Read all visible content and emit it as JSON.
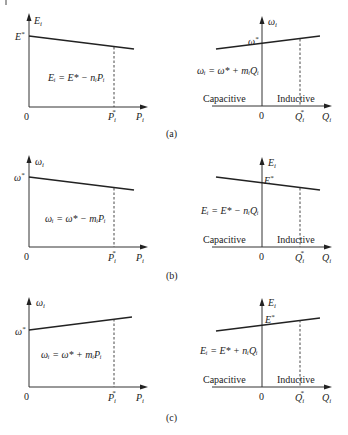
{
  "figure": {
    "panels": [
      {
        "id": "a",
        "caption": "(a)",
        "left": {
          "y_axis_label": "E",
          "y_axis_sub": "i",
          "x_axis_label": "P",
          "x_axis_sub": "i",
          "origin": "0",
          "intercept_label": "E",
          "intercept_sup": "*",
          "rated_label": "P",
          "rated_sub": "i",
          "rated_sup": "*",
          "equation": "Eᵢ = E* − nᵢPᵢ",
          "slope": "negative"
        },
        "right": {
          "y_axis_label": "ω",
          "y_axis_sub": "i",
          "x_axis_label": "Q",
          "x_axis_sub": "i",
          "origin": "0",
          "intercept_label": "ω",
          "intercept_sup": "*",
          "rated_label": "Q",
          "rated_sub": "i",
          "rated_sup": "*",
          "equation": "ωᵢ = ω* + mᵢQᵢ",
          "region_left": "Capacitive",
          "region_right": "Inductive",
          "slope": "positive"
        }
      },
      {
        "id": "b",
        "caption": "(b)",
        "left": {
          "y_axis_label": "ω",
          "y_axis_sub": "i",
          "x_axis_label": "P",
          "x_axis_sub": "i",
          "origin": "0",
          "intercept_label": "ω",
          "intercept_sup": "*",
          "rated_label": "P",
          "rated_sub": "i",
          "rated_sup": "*",
          "equation": "ωᵢ = ω* − mᵢPᵢ",
          "slope": "negative"
        },
        "right": {
          "y_axis_label": "E",
          "y_axis_sub": "i",
          "x_axis_label": "Q",
          "x_axis_sub": "i",
          "origin": "0",
          "intercept_label": "E",
          "intercept_sup": "*",
          "rated_label": "Q",
          "rated_sub": "i",
          "rated_sup": "*",
          "equation": "Eᵢ = E* − nᵢQᵢ",
          "region_left": "Capacitive",
          "region_right": "Inductive",
          "slope": "negative"
        }
      },
      {
        "id": "c",
        "caption": "(c)",
        "left": {
          "y_axis_label": "ω",
          "y_axis_sub": "i",
          "x_axis_label": "P",
          "x_axis_sub": "i",
          "origin": "0",
          "intercept_label": "ω",
          "intercept_sup": "*",
          "rated_label": "P",
          "rated_sub": "i",
          "rated_sup": "*",
          "equation": "ωᵢ = ω* + mᵢPᵢ",
          "slope": "positive"
        },
        "right": {
          "y_axis_label": "E",
          "y_axis_sub": "i",
          "x_axis_label": "Q",
          "x_axis_sub": "i",
          "origin": "0",
          "intercept_label": "E",
          "intercept_sup": "*",
          "rated_label": "Q",
          "rated_sub": "i",
          "rated_sup": "*",
          "equation": "Eᵢ = E* + nᵢQᵢ",
          "region_left": "Capacitive",
          "region_right": "Inductive",
          "slope": "positive"
        }
      }
    ]
  }
}
